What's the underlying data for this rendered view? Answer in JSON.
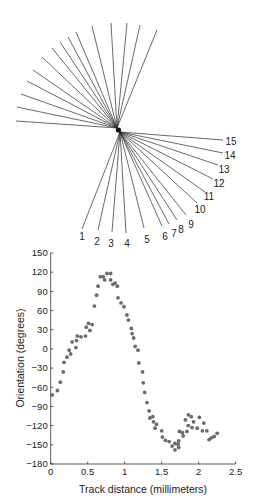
{
  "fan_diagram": {
    "upper_origin": [
      117,
      128
    ],
    "lower_origin": [
      120,
      132
    ],
    "upper_endpoints": [
      [
        16,
        121
      ],
      [
        17,
        107
      ],
      [
        21,
        94
      ],
      [
        27,
        81
      ],
      [
        33,
        70
      ],
      [
        42,
        57
      ],
      [
        52,
        48
      ],
      [
        60,
        42
      ],
      [
        68,
        37
      ],
      [
        76,
        32
      ],
      [
        92,
        26
      ],
      [
        111,
        23
      ],
      [
        127,
        23
      ],
      [
        140,
        25
      ],
      [
        157,
        30
      ]
    ],
    "lower_lines": [
      {
        "label": "1",
        "end": [
          82,
          229
        ],
        "label_pos": [
          82,
          240
        ]
      },
      {
        "label": "2",
        "end": [
          98,
          230
        ],
        "label_pos": [
          97,
          245
        ]
      },
      {
        "label": "3",
        "end": [
          112,
          232
        ],
        "label_pos": [
          111,
          247
        ]
      },
      {
        "label": "4",
        "end": [
          126,
          233
        ],
        "label_pos": [
          127,
          247
        ]
      },
      {
        "label": "5",
        "end": [
          144,
          228
        ],
        "label_pos": [
          147,
          243
        ]
      },
      {
        "label": "6",
        "end": [
          162,
          226
        ],
        "label_pos": [
          165,
          240
        ]
      },
      {
        "label": "7",
        "end": [
          169,
          224
        ],
        "label_pos": [
          174,
          237
        ]
      },
      {
        "label": "8",
        "end": [
          177,
          220
        ],
        "label_pos": [
          181,
          233
        ]
      },
      {
        "label": "9",
        "end": [
          186,
          215
        ],
        "label_pos": [
          191,
          228
        ]
      },
      {
        "label": "10",
        "end": [
          197,
          203
        ],
        "label_pos": [
          200,
          213
        ]
      },
      {
        "label": "11",
        "end": [
          205,
          192
        ],
        "label_pos": [
          209,
          200
        ]
      },
      {
        "label": "12",
        "end": [
          213,
          179
        ],
        "label_pos": [
          219,
          187
        ]
      },
      {
        "label": "13",
        "end": [
          218,
          165
        ],
        "label_pos": [
          224,
          173
        ]
      },
      {
        "label": "14",
        "end": [
          223,
          153
        ],
        "label_pos": [
          230,
          159
        ]
      },
      {
        "label": "15",
        "end": [
          223,
          140
        ],
        "label_pos": [
          231,
          145
        ]
      }
    ]
  },
  "chart_data": {
    "type": "scatter",
    "title": "",
    "xlabel": "Track distance (millimeters)",
    "ylabel": "Orientation (degrees)",
    "xlim": [
      0,
      2.5
    ],
    "ylim": [
      -180,
      150
    ],
    "xticks": [
      0,
      0.5,
      1,
      1.5,
      2,
      2.5
    ],
    "xtick_labels": [
      "0",
      "0.5",
      "1",
      "1.5",
      "2",
      "2.5"
    ],
    "yticks": [
      150,
      120,
      90,
      60,
      30,
      0,
      -30,
      -60,
      -90,
      -120,
      -150,
      -180
    ],
    "ytick_labels": [
      "150",
      "120",
      "90",
      "60",
      "30",
      "0",
      "−30",
      "−60",
      "−90",
      "−120",
      "−150",
      "−180"
    ],
    "grid": false,
    "legend": null,
    "marker_color": "#6b6b6b",
    "x": [
      0.02,
      0.09,
      0.13,
      0.17,
      0.18,
      0.22,
      0.25,
      0.27,
      0.29,
      0.34,
      0.35,
      0.36,
      0.41,
      0.47,
      0.48,
      0.51,
      0.53,
      0.56,
      0.59,
      0.62,
      0.64,
      0.67,
      0.71,
      0.73,
      0.76,
      0.81,
      0.81,
      0.84,
      0.87,
      0.9,
      0.91,
      0.95,
      0.99,
      1.03,
      1.05,
      1.09,
      1.1,
      1.12,
      1.14,
      1.18,
      1.19,
      1.24,
      1.25,
      1.27,
      1.3,
      1.33,
      1.34,
      1.38,
      1.39,
      1.41,
      1.43,
      1.5,
      1.51,
      1.55,
      1.6,
      1.64,
      1.68,
      1.68,
      1.72,
      1.73,
      1.73,
      1.74,
      1.78,
      1.79,
      1.82,
      1.84,
      1.86,
      1.86,
      1.9,
      1.91,
      1.93,
      1.98,
      2.01,
      2.05,
      2.07,
      2.11,
      2.14,
      2.17,
      2.21,
      2.25
    ],
    "y": [
      -72,
      -65,
      -52,
      -36,
      -21,
      -13,
      -2,
      -8,
      11,
      2,
      13,
      20,
      19,
      20,
      34,
      40,
      29,
      38,
      67,
      84,
      98,
      113,
      113,
      108,
      118,
      118,
      108,
      101,
      103,
      98,
      80,
      72,
      66,
      53,
      45,
      32,
      24,
      17,
      4,
      -2,
      -22,
      -36,
      -53,
      -68,
      -84,
      -97,
      -108,
      -106,
      -114,
      -124,
      -118,
      -128,
      -138,
      -143,
      -145,
      -152,
      -148,
      -158,
      -149,
      -154,
      -144,
      -129,
      -131,
      -136,
      -111,
      -129,
      -120,
      -103,
      -106,
      -123,
      -114,
      -124,
      -107,
      -128,
      -116,
      -128,
      -142,
      -139,
      -137,
      -132
    ]
  },
  "plot_layout": {
    "x0_px": 50.7,
    "px_per_x": 74.0,
    "y_bottom_px": 464.0,
    "y_top_px": 253.0
  }
}
